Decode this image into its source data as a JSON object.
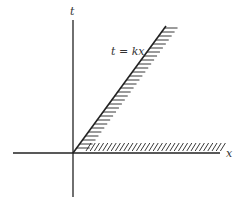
{
  "diagram": {
    "axis_x_label": "x",
    "axis_t_label": "t",
    "line_label": "t = kx",
    "colors": {
      "ink": "#222222",
      "background": "#ffffff"
    }
  }
}
